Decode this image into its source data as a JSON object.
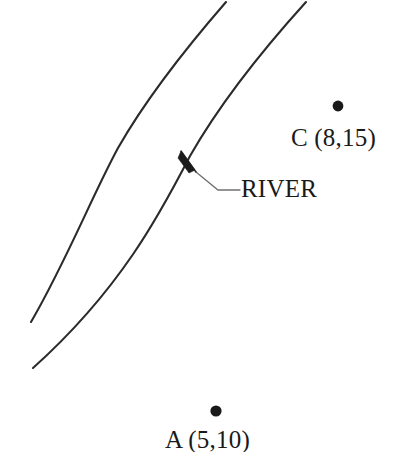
{
  "figure": {
    "kind": "river-location-diagram",
    "background_color": "#ffffff",
    "ink_color": "#2b2b2b",
    "leader_color": "#6f6f6f"
  },
  "annotations": {
    "river_label": "RIVER",
    "point_c_label": "C (8,15)",
    "point_a_label": "A (5,10)"
  },
  "points": [
    {
      "id": "C",
      "label": "C (8,15)",
      "coordinates": "(8,15)",
      "x": 8,
      "y": 15,
      "marker_cx": 338,
      "marker_cy": 106,
      "marker_r": 5.4
    },
    {
      "id": "A",
      "label": "A (5,10)",
      "coordinates": "(5,10)",
      "x": 5,
      "y": 10,
      "marker_cx": 216,
      "marker_cy": 411,
      "marker_r": 5.6
    }
  ],
  "river": {
    "label": "RIVER",
    "left_bank_path": "M 226 2 C 193 40 150 92 118 148 C 92 196 66 262 31 322",
    "right_bank_path": "M 306 2 C 268 44 222 100 190 156 C 160 214 120 290 33 368",
    "arrow": {
      "tip_x": 181,
      "tip_y": 151,
      "shaft_start_x": 196,
      "shaft_start_y": 172,
      "head_points": "181,151 195,170 189,173 178,158"
    },
    "leader": {
      "path": "M 196 172 L 218 190 L 240 190"
    }
  }
}
